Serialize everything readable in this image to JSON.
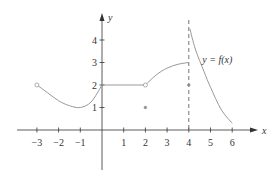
{
  "chart_data": {
    "type": "line",
    "title": "",
    "xlabel": "x",
    "ylabel": "y",
    "xlim": [
      -3.5,
      6.8
    ],
    "ylim": [
      -1.8,
      4.7
    ],
    "grid": false,
    "x_ticks": [
      -3,
      -2,
      -1,
      1,
      2,
      3,
      4,
      5,
      6
    ],
    "x_tick_labels": [
      "−3",
      "−2",
      "−1",
      "1",
      "2",
      "3",
      "4",
      "5",
      "6"
    ],
    "y_ticks": [
      1,
      2,
      3,
      4
    ],
    "y_tick_labels": [
      "1",
      "2",
      "3",
      "4"
    ],
    "annotations": [
      {
        "text": "y = f(x)",
        "x": 4.9,
        "y": 3.1
      }
    ],
    "series": [
      {
        "name": "segment-1",
        "description": "curve from open circle at (-3,2) dipping to min ~(-1,1) up to (0,2)",
        "x": [
          -3,
          -2.5,
          -2,
          -1.5,
          -1,
          -0.5,
          0
        ],
        "y": [
          2,
          1.65,
          1.3,
          1.08,
          1.0,
          1.25,
          2
        ]
      },
      {
        "name": "segment-2",
        "description": "horizontal line y=2 from x=0 to open circle at x=2",
        "x": [
          0,
          2
        ],
        "y": [
          2,
          2
        ]
      },
      {
        "name": "segment-3",
        "description": "concave-down curve from (2,2) rising to (4,3)",
        "x": [
          2,
          2.5,
          3,
          3.5,
          4
        ],
        "y": [
          2,
          2.45,
          2.75,
          2.92,
          3
        ]
      },
      {
        "name": "segment-4",
        "description": "decreasing curve from near vertical asymptote x=4 down to (6,0.3)",
        "x": [
          4.05,
          4.3,
          4.7,
          5,
          5.5,
          6
        ],
        "y": [
          4.5,
          3.6,
          2.6,
          1.9,
          0.9,
          0.3
        ]
      }
    ],
    "points": [
      {
        "x": -3,
        "y": 2,
        "style": "open"
      },
      {
        "x": 2,
        "y": 2,
        "style": "open"
      },
      {
        "x": 2,
        "y": 1,
        "style": "filled"
      },
      {
        "x": 4,
        "y": 2,
        "style": "filled"
      }
    ],
    "asymptotes": [
      {
        "type": "vertical",
        "x": 4,
        "style": "dashed"
      }
    ]
  }
}
